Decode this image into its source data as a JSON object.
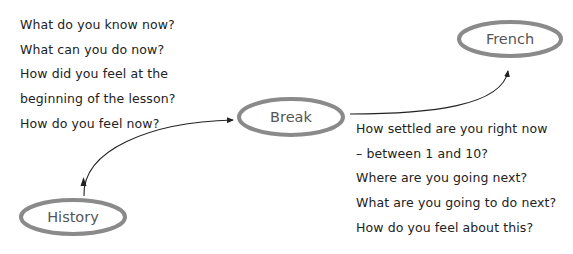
{
  "diagram": {
    "nodes": [
      {
        "id": "history",
        "label": "History"
      },
      {
        "id": "break",
        "label": "Break"
      },
      {
        "id": "french",
        "label": "French"
      }
    ],
    "edges": [
      {
        "from": "history",
        "to": "break"
      },
      {
        "from": "break",
        "to": "french"
      }
    ],
    "left_questions": [
      "What do you know now?",
      "What can you do now?",
      "How did you feel at the",
      "beginning of the lesson?",
      "How do you feel now?"
    ],
    "right_questions": [
      "How settled are you right now",
      "– between 1 and 10?",
      "Where are you going next?",
      "What are you going to do next?",
      "How do you feel about this?"
    ],
    "colors": {
      "node_stroke": "#8a8a8a",
      "node_label": "#555555",
      "text": "#222222",
      "arrow": "#222222",
      "background": "#ffffff"
    }
  }
}
